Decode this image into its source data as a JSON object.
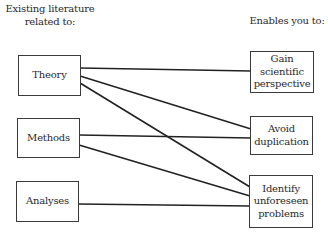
{
  "diagram": {
    "left_header": [
      "Existing literature",
      "related to:"
    ],
    "right_header": "Enables you to:",
    "sources": [
      {
        "id": "theory",
        "label": "Theory"
      },
      {
        "id": "methods",
        "label": "Methods"
      },
      {
        "id": "analyses",
        "label": "Analyses"
      }
    ],
    "targets": [
      {
        "id": "gain",
        "lines": [
          "Gain",
          "scientific",
          "perspective"
        ]
      },
      {
        "id": "avoid",
        "lines": [
          "Avoid",
          "duplication"
        ]
      },
      {
        "id": "identify",
        "lines": [
          "Identify",
          "unforeseen",
          "problems"
        ]
      }
    ],
    "connections": [
      {
        "from": "theory",
        "to": "gain"
      },
      {
        "from": "theory",
        "to": "avoid"
      },
      {
        "from": "theory",
        "to": "identify"
      },
      {
        "from": "methods",
        "to": "avoid"
      },
      {
        "from": "methods",
        "to": "identify"
      },
      {
        "from": "analyses",
        "to": "identify"
      }
    ],
    "colors": {
      "line": "#222222",
      "border": "#3a3a3a",
      "text": "#2a2a2a",
      "background": "#ffffff"
    }
  }
}
